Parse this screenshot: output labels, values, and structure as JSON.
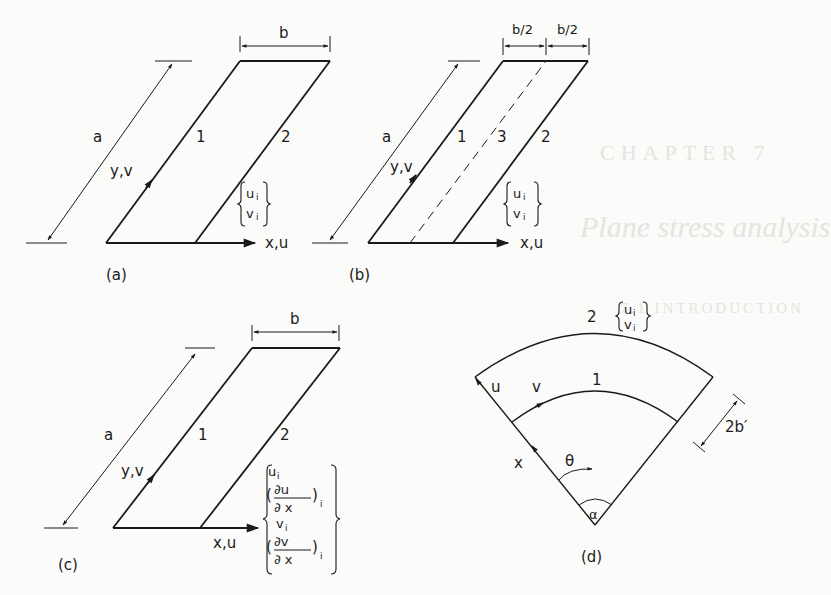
{
  "figure": {
    "panels": [
      {
        "id": "a",
        "caption": "(a)",
        "dimension_length": "a",
        "dimension_width": "b",
        "axis_y": "y,v",
        "axis_x": "x,u",
        "nodal_lines": [
          "1",
          "2"
        ],
        "dof_vector": [
          "u_i",
          "v_i"
        ]
      },
      {
        "id": "b",
        "caption": "(b)",
        "dimension_length": "a",
        "dimension_half_widths": [
          "b/2",
          "b/2"
        ],
        "axis_y": "y,v",
        "axis_x": "x,u",
        "nodal_lines": [
          "1",
          "3",
          "2"
        ],
        "dof_vector": [
          "u_i",
          "v_i"
        ]
      },
      {
        "id": "c",
        "caption": "(c)",
        "dimension_length": "a",
        "dimension_width": "b",
        "axis_y": "y,v",
        "axis_x": "x,u",
        "nodal_lines": [
          "1",
          "2"
        ],
        "dof_vector": [
          "u_i",
          "(∂u/∂x)_i",
          "v_i",
          "(∂v/∂x)_i"
        ]
      },
      {
        "id": "d",
        "caption": "(d)",
        "nodal_lines": [
          "1",
          "2"
        ],
        "dof_vector": [
          "u_i",
          "v_i"
        ],
        "radial_axis": "x",
        "displacements": [
          "u",
          "v"
        ],
        "angle_coordinate": "θ",
        "sector_angle": "α",
        "strip_width": "2b′"
      }
    ]
  },
  "labels": {
    "a": {
      "a": "a",
      "yv": "y,v",
      "n1": "1",
      "n2": "2",
      "xu": "x,u",
      "cap": "(a)",
      "b": "b",
      "ui": "u",
      "vi": "v",
      "sub": "i"
    },
    "b": {
      "a": "a",
      "yv": "y,v",
      "n1": "1",
      "n3": "3",
      "n2": "2",
      "xu": "x,u",
      "cap": "(b)",
      "b1": "b/2",
      "b2": "b/2",
      "ui": "u",
      "vi": "v",
      "sub": "i"
    },
    "c": {
      "a": "a",
      "yv": "y,v",
      "n1": "1",
      "n2": "2",
      "xu": "x,u",
      "cap": "(c)",
      "b": "b",
      "ui": "u",
      "vi": "v",
      "sub": "i",
      "du": "∂u",
      "dv": "∂v",
      "dx": "∂ x",
      "lp": "(",
      "rp": ")"
    },
    "d": {
      "n2": "2",
      "n1": "1",
      "u": "u",
      "v": "v",
      "x": "x",
      "theta": "θ",
      "alpha": "α",
      "width": "2b′",
      "cap": "(d)",
      "ui": "u",
      "vi": "v",
      "sub": "i"
    }
  },
  "bleed_through": {
    "chapter": "CHAPTER 7",
    "title": "Plane stress analysis",
    "section": "7.1 INTRODUCTION"
  }
}
